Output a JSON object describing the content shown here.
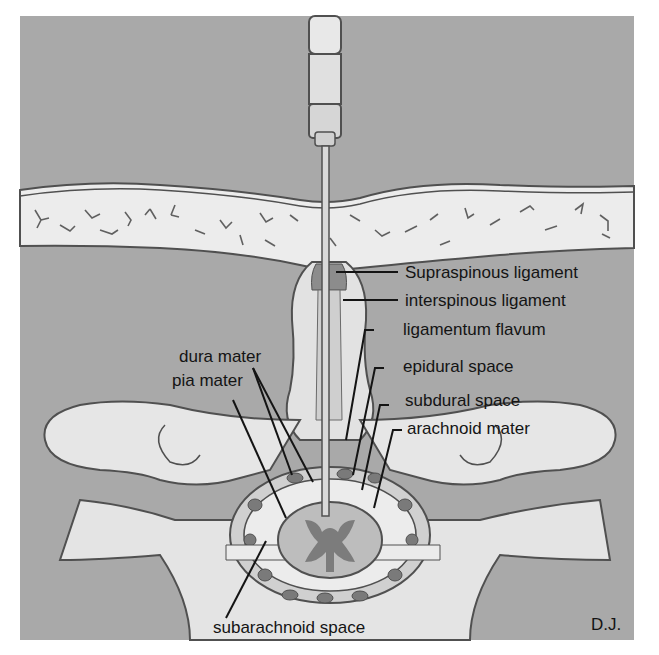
{
  "diagram": {
    "colors": {
      "background": "#a9a9a9",
      "skin": "#ececec",
      "bone": "#e6e6e6",
      "ligament_dark": "#8c8c8c",
      "cord": "#bdbdbd",
      "grey_matter": "#7c7c7c",
      "outline": "#505050",
      "text": "#141414"
    },
    "labels": {
      "supraspinous": "Supraspinous ligament",
      "interspinous": "interspinous ligament",
      "flavum": "ligamentum flavum",
      "epidural": "epidural space",
      "subdural": "subdural space",
      "arachnoid": "arachnoid mater",
      "dura": "dura mater",
      "pia": "pia mater",
      "subarachnoid": "subarachnoid space"
    },
    "signature": "D.J."
  }
}
